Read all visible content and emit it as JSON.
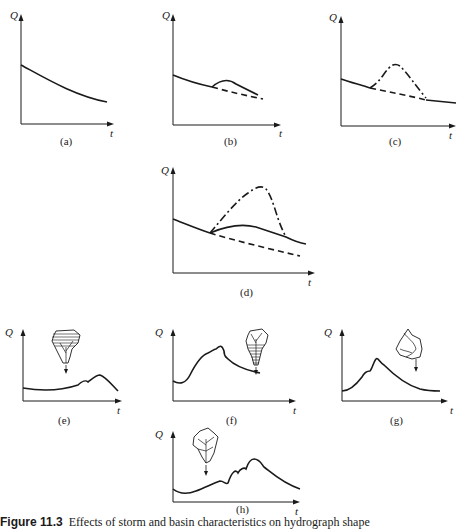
{
  "figure": {
    "caption_prefix": "Figure 11.3",
    "caption_text": "Effects of storm and basin characteristics on hydrograph shape"
  },
  "axes": {
    "y_label": "Q",
    "x_label": "t"
  },
  "panels": [
    {
      "id": "a",
      "label": "(a)",
      "description": "Baseflow recession only (solid)"
    },
    {
      "id": "b",
      "label": "(b)",
      "description": "Small rise above recession; dashed continuing recession"
    },
    {
      "id": "c",
      "label": "(c)",
      "description": "Dash-dot peak above dashed recession"
    },
    {
      "id": "d",
      "label": "(d)",
      "description": "Dash-dot large peak, solid moderate rise, dashed recession"
    },
    {
      "id": "e",
      "label": "(e)",
      "description": "Rain over upper basin (hatched top) — delayed peak",
      "icon": "catchment-upper-hatched-icon"
    },
    {
      "id": "f",
      "label": "(f)",
      "description": "Rain over lower basin (hatched bottom) — early peak",
      "icon": "catchment-lower-hatched-icon"
    },
    {
      "id": "g",
      "label": "(g)",
      "description": "Uniform rain over basin — single peak",
      "icon": "catchment-icon"
    },
    {
      "id": "h",
      "label": "(h)",
      "description": "Storm moving upstream — prolonged multiple peaks",
      "icon": "catchment-icon"
    }
  ],
  "line_styles": {
    "solid": "actual hydrograph",
    "dashed": "baseflow recession",
    "dash_dot": "storm runoff hydrograph"
  }
}
